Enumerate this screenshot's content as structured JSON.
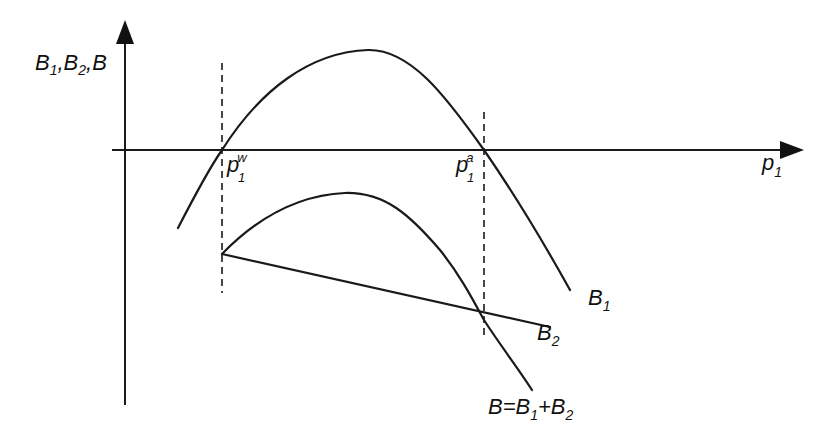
{
  "diagram": {
    "y_axis_label": {
      "b1": "B",
      "s1": "1",
      "sep1": ",B",
      "s2": "2",
      "sep2": ",B"
    },
    "x_axis_label": {
      "base": "p",
      "sub": "1"
    },
    "marker_left": {
      "base": "p",
      "sub": "1",
      "sup": "w"
    },
    "marker_right": {
      "base": "p",
      "sub": "1",
      "sup": "a"
    },
    "curve_b1_label": {
      "base": "B",
      "sub": "1"
    },
    "curve_b2_label": {
      "base": "B",
      "sub": "2"
    },
    "curve_b_label": {
      "a": "B=B",
      "s1": "1",
      "plus": "+B",
      "s2": "2"
    }
  }
}
